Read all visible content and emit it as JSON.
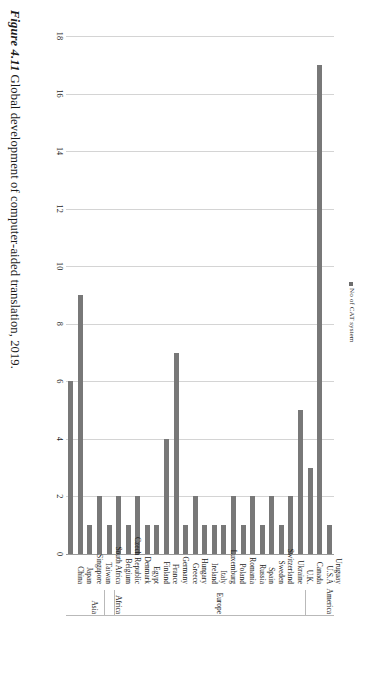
{
  "figure": {
    "number": "Figure 4.11",
    "caption": "Global development of computer-aided translation, 2019."
  },
  "legend": {
    "items": [
      {
        "label": "No of CAT system",
        "color": "#787878",
        "marker": "square-marker-icon"
      }
    ]
  },
  "chart_data": {
    "type": "bar",
    "orientation": "horizontal",
    "title": "",
    "xlabel": "",
    "ylabel": "",
    "xlim": [
      0,
      18
    ],
    "xticks": [
      0,
      2,
      4,
      6,
      8,
      10,
      12,
      14,
      16,
      18
    ],
    "xticklabels": [
      "0",
      "2",
      "4",
      "6",
      "8",
      "10",
      "12",
      "14",
      "16",
      "18"
    ],
    "grid": true,
    "legend_position": "top-center",
    "series_name": "No of CAT system",
    "bar_color": "#787878",
    "categories": [
      "China",
      "Japan",
      "Singapore",
      "Taiwan",
      "South Africa",
      "Belgium",
      "Czech Republic",
      "Denmark",
      "Egypt",
      "Finland",
      "France",
      "Germany",
      "Greece",
      "Hungary",
      "Ireland",
      "Italy",
      "Luxemburg",
      "Poland",
      "Romania",
      "Russia",
      "Spain",
      "Sweden",
      "Switzerland",
      "Ukraine",
      "U.K.",
      "Canada",
      "U.S.A",
      "Uruguay"
    ],
    "values": [
      6,
      9,
      1,
      2,
      1,
      2,
      1,
      2,
      1,
      1,
      4,
      7,
      1,
      2,
      1,
      1,
      1,
      2,
      1,
      2,
      1,
      2,
      1,
      2,
      5,
      3,
      17,
      1
    ],
    "groups": [
      {
        "name": "Asia",
        "categories": [
          "China",
          "Japan",
          "Singapore",
          "Taiwan"
        ]
      },
      {
        "name": "Africa",
        "categories": [
          "South Africa"
        ]
      },
      {
        "name": "Europe",
        "categories": [
          "Belgium",
          "Czech Republic",
          "Denmark",
          "Egypt",
          "Finland",
          "France",
          "Germany",
          "Greece",
          "Hungary",
          "Ireland",
          "Italy",
          "Luxemburg",
          "Poland",
          "Romania",
          "Russia",
          "Spain",
          "Sweden",
          "Switzerland",
          "Ukraine",
          "U.K."
        ]
      },
      {
        "name": "America",
        "categories": [
          "Canada",
          "U.S.A",
          "Uruguay"
        ]
      }
    ]
  }
}
